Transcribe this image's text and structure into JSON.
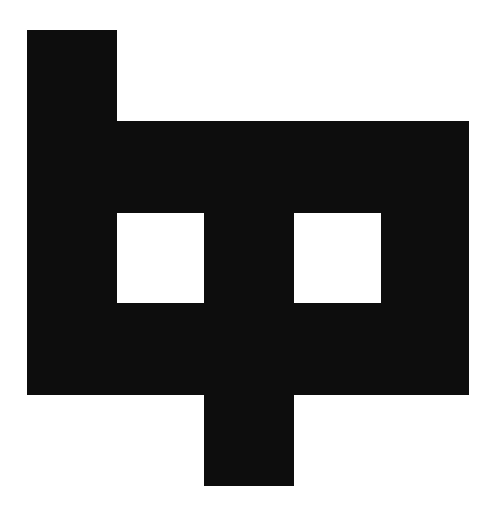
{
  "figure": {
    "background": "#ffffff",
    "fill": "#0d0d0d",
    "grid": {
      "origin_x": 27,
      "origin_y": 30,
      "col_edges": [
        27,
        116,
        204,
        293,
        381,
        468
      ],
      "row_edges": [
        30,
        121,
        212,
        303,
        394,
        485
      ]
    },
    "filled_cells": [
      {
        "row": 0,
        "col": 0
      },
      {
        "row": 1,
        "col": 0
      },
      {
        "row": 1,
        "col": 1
      },
      {
        "row": 1,
        "col": 2
      },
      {
        "row": 1,
        "col": 3
      },
      {
        "row": 1,
        "col": 4
      },
      {
        "row": 2,
        "col": 0
      },
      {
        "row": 2,
        "col": 2
      },
      {
        "row": 2,
        "col": 4
      },
      {
        "row": 3,
        "col": 0
      },
      {
        "row": 3,
        "col": 1
      },
      {
        "row": 3,
        "col": 2
      },
      {
        "row": 3,
        "col": 3
      },
      {
        "row": 3,
        "col": 4
      },
      {
        "row": 4,
        "col": 2
      }
    ]
  }
}
